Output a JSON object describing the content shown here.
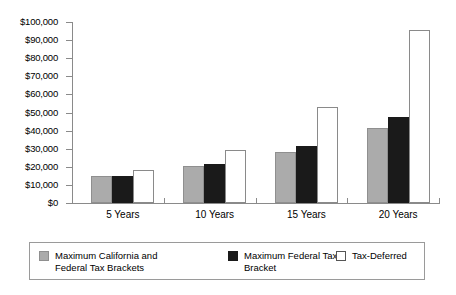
{
  "chart_data": {
    "type": "bar",
    "title": "",
    "subtitle": "",
    "xlabel": "",
    "ylabel": "",
    "categories": [
      "5 Years",
      "10 Years",
      "15 Years",
      "20 Years"
    ],
    "series": [
      {
        "name": "Maximum California and Federal Tax Brackets",
        "color": "#ababab",
        "values": [
          15000,
          20500,
          28000,
          41500
        ]
      },
      {
        "name": "Maximum Federal Tax Bracket",
        "color": "#1a1a1a",
        "values": [
          15000,
          21500,
          31500,
          47500
        ]
      },
      {
        "name": "Tax-Deferred",
        "color": "#ffffff",
        "values": [
          18000,
          29500,
          53000,
          95500
        ]
      }
    ],
    "ylim": [
      0,
      100000
    ],
    "ytick_values": [
      0,
      10000,
      20000,
      30000,
      40000,
      50000,
      60000,
      70000,
      80000,
      90000,
      100000
    ],
    "ytick_labels": [
      "$0",
      "$10,000",
      "$20,000",
      "$30,000",
      "$40,000",
      "$50,000",
      "$60,000",
      "$70,000",
      "$80,000",
      "$90,000",
      "$100,000"
    ],
    "grid": false,
    "legend_position": "bottom"
  }
}
